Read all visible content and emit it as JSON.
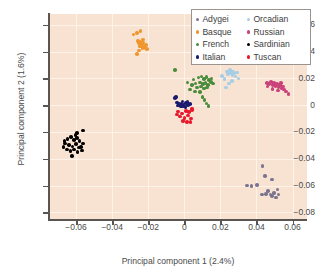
{
  "chart_data": {
    "type": "scatter",
    "title": "",
    "xlabel": "Principal component 1 (2.4%)",
    "ylabel": "Principal component 2 (1.6%)",
    "xlim": [
      -0.075,
      0.068
    ],
    "ylim": [
      -0.085,
      0.068
    ],
    "xticks": [
      "-0.06",
      "-0.04",
      "-0.02",
      "0",
      "0.02",
      "0.04",
      "0.06"
    ],
    "xtickvals": [
      -0.06,
      -0.04,
      -0.02,
      0,
      0.02,
      0.04,
      0.06
    ],
    "yticks": [
      "0.06",
      "0.04",
      "0.02",
      "0",
      "-0.02",
      "-0.04",
      "-0.06",
      "-0.08"
    ],
    "ytickvals": [
      0.06,
      0.04,
      0.02,
      0,
      -0.02,
      -0.04,
      -0.06,
      -0.08
    ],
    "grid": true,
    "plot_background": "#f8e2d2",
    "gridline_color": "#fdf3ea",
    "legend_position": "top-right",
    "legend_order": [
      "Adygei",
      "Orcadian",
      "Basque",
      "Russian",
      "French",
      "Sardinian",
      "Italian",
      "Tuscan"
    ],
    "series": [
      {
        "name": "Adygei",
        "color": "#7a7490",
        "points": [
          [
            0.0348,
            -0.06
          ],
          [
            0.0372,
            -0.0604
          ],
          [
            0.0404,
            -0.0597
          ],
          [
            0.0432,
            -0.0668
          ],
          [
            0.0452,
            -0.0665
          ],
          [
            0.0464,
            -0.0643
          ],
          [
            0.0478,
            -0.0668
          ],
          [
            0.0487,
            -0.068
          ],
          [
            0.0498,
            -0.0657
          ],
          [
            0.0508,
            -0.069
          ],
          [
            0.0523,
            -0.0667
          ],
          [
            0.0446,
            -0.0528
          ],
          [
            0.0486,
            -0.0556
          ],
          [
            0.0434,
            -0.0455
          ],
          [
            0.0516,
            -0.063
          ]
        ]
      },
      {
        "name": "Orcadian",
        "color": "#a7cde4",
        "points": [
          [
            0.021,
            0.0217
          ],
          [
            0.0222,
            0.0193
          ],
          [
            0.0237,
            0.0252
          ],
          [
            0.0243,
            0.0234
          ],
          [
            0.0252,
            0.0262
          ],
          [
            0.0258,
            0.024
          ],
          [
            0.0266,
            0.0225
          ],
          [
            0.0271,
            0.0252
          ],
          [
            0.0278,
            0.0237
          ],
          [
            0.0284,
            0.0214
          ],
          [
            0.0291,
            0.0244
          ],
          [
            0.0264,
            0.018
          ],
          [
            0.0248,
            0.016
          ],
          [
            0.023,
            0.0132
          ],
          [
            0.03,
            0.02
          ]
        ]
      },
      {
        "name": "Basque",
        "color": "#f0962e",
        "points": [
          [
            -0.0282,
            0.0527
          ],
          [
            -0.0263,
            0.054
          ],
          [
            -0.0242,
            0.0552
          ],
          [
            -0.0258,
            0.0478
          ],
          [
            -0.025,
            0.0462
          ],
          [
            -0.0243,
            0.047
          ],
          [
            -0.0236,
            0.0455
          ],
          [
            -0.0229,
            0.0466
          ],
          [
            -0.0248,
            0.0441
          ],
          [
            -0.024,
            0.0436
          ],
          [
            -0.0232,
            0.0428
          ],
          [
            -0.0224,
            0.0432
          ],
          [
            -0.0216,
            0.0424
          ],
          [
            -0.0208,
            0.042
          ],
          [
            -0.0252,
            0.0408
          ],
          [
            -0.0262,
            0.0383
          ],
          [
            -0.0228,
            0.0491
          ],
          [
            -0.0212,
            0.0448
          ]
        ]
      },
      {
        "name": "Russian",
        "color": "#c9427a",
        "points": [
          [
            0.0458,
            0.0163
          ],
          [
            0.047,
            0.0156
          ],
          [
            0.0481,
            0.0172
          ],
          [
            0.049,
            0.0152
          ],
          [
            0.0498,
            0.0165
          ],
          [
            0.0506,
            0.0143
          ],
          [
            0.0514,
            0.0158
          ],
          [
            0.0522,
            0.0136
          ],
          [
            0.053,
            0.0148
          ],
          [
            0.0538,
            0.0128
          ],
          [
            0.0546,
            0.014
          ],
          [
            0.0554,
            0.0118
          ],
          [
            0.0562,
            0.0102
          ],
          [
            0.0518,
            0.011
          ],
          [
            0.0488,
            0.0122
          ],
          [
            0.0462,
            0.0138
          ],
          [
            0.0577,
            0.0082
          ],
          [
            0.0536,
            0.0165
          ]
        ]
      },
      {
        "name": "French",
        "color": "#4a8c3c",
        "points": [
          [
            0.0052,
            0.0192
          ],
          [
            0.0078,
            0.0206
          ],
          [
            0.0096,
            0.0214
          ],
          [
            0.011,
            0.0196
          ],
          [
            0.0124,
            0.0208
          ],
          [
            0.0136,
            0.0186
          ],
          [
            0.015,
            0.0198
          ],
          [
            0.0062,
            0.0162
          ],
          [
            0.0086,
            0.017
          ],
          [
            0.0104,
            0.0156
          ],
          [
            0.0118,
            0.0166
          ],
          [
            0.0132,
            0.0152
          ],
          [
            0.007,
            0.013
          ],
          [
            0.0092,
            0.0138
          ],
          [
            0.011,
            0.0124
          ],
          [
            0.0126,
            0.0132
          ],
          [
            0.0044,
            0.0148
          ],
          [
            0.0018,
            0.0168
          ],
          [
            0.0032,
            0.0116
          ],
          [
            0.0058,
            0.0102
          ],
          [
            0.0086,
            0.0096
          ],
          [
            0.01,
            0.0062
          ],
          [
            0.0112,
            0.004
          ],
          [
            0.0122,
            0.0012
          ],
          [
            0.0134,
            -0.0008
          ],
          [
            -0.0052,
            0.0262
          ],
          [
            0.0148,
            0.0172
          ],
          [
            0.016,
            0.016
          ]
        ]
      },
      {
        "name": "Sardinian",
        "color": "#000000",
        "points": [
          [
            -0.0648,
            -0.0252
          ],
          [
            -0.0628,
            -0.0238
          ],
          [
            -0.0612,
            -0.0262
          ],
          [
            -0.0596,
            -0.0244
          ],
          [
            -0.058,
            -0.0268
          ],
          [
            -0.066,
            -0.0288
          ],
          [
            -0.064,
            -0.0296
          ],
          [
            -0.062,
            -0.0308
          ],
          [
            -0.06,
            -0.0292
          ],
          [
            -0.0584,
            -0.0316
          ],
          [
            -0.067,
            -0.0312
          ],
          [
            -0.065,
            -0.033
          ],
          [
            -0.063,
            -0.0344
          ],
          [
            -0.061,
            -0.033
          ],
          [
            -0.0592,
            -0.0352
          ],
          [
            -0.0572,
            -0.0312
          ],
          [
            -0.056,
            -0.0286
          ],
          [
            -0.0568,
            -0.0338
          ],
          [
            -0.0624,
            -0.0378
          ],
          [
            -0.0596,
            -0.0208
          ],
          [
            -0.056,
            -0.0188
          ],
          [
            -0.0664,
            -0.027
          ],
          [
            -0.0604,
            -0.0222
          ]
        ]
      },
      {
        "name": "Italian",
        "color": "#1a1a6e",
        "points": [
          [
            -0.0052,
            0.0052
          ],
          [
            -0.0042,
            0.002
          ],
          [
            -0.0028,
            0.0008
          ],
          [
            -0.0016,
            0.0012
          ],
          [
            -0.0004,
            0.0004
          ],
          [
            0.0008,
            0.0014
          ],
          [
            0.002,
            0.0002
          ],
          [
            0.0032,
            0.001
          ],
          [
            -0.0034,
            -0.0004
          ],
          [
            -0.002,
            -0.001
          ],
          [
            -0.0006,
            -0.0006
          ],
          [
            0.0006,
            -0.0012
          ],
          [
            -0.0046,
            0.0062
          ],
          [
            0.0018,
            0.0022
          ],
          [
            -0.001,
            0.0026
          ]
        ]
      },
      {
        "name": "Tuscan",
        "color": "#e8192c",
        "points": [
          [
            -0.0034,
            -0.0048
          ],
          [
            -0.0012,
            -0.0062
          ],
          [
            0.001,
            -0.0042
          ],
          [
            0.0026,
            -0.0052
          ],
          [
            0.0042,
            -0.0038
          ],
          [
            -0.0024,
            -0.0084
          ],
          [
            0.0,
            -0.0096
          ],
          [
            0.002,
            -0.0078
          ],
          [
            0.0036,
            -0.01
          ],
          [
            -0.0008,
            -0.0118
          ],
          [
            0.0016,
            -0.0124
          ],
          [
            0.0034,
            -0.0126
          ],
          [
            0.0044,
            -0.0024
          ],
          [
            -0.004,
            -0.007
          ]
        ]
      }
    ]
  }
}
